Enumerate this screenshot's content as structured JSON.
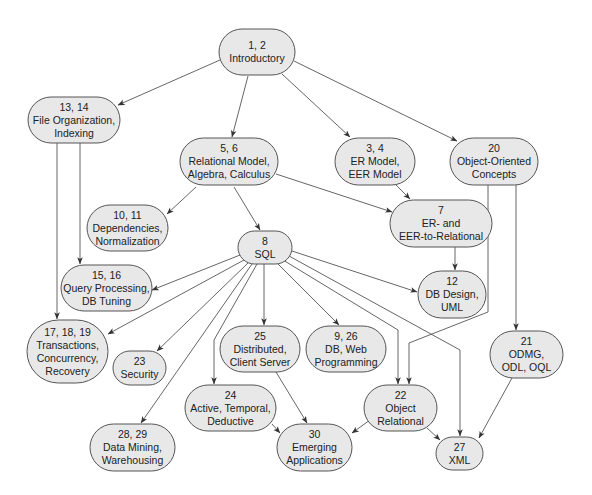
{
  "diagram": {
    "colors": {
      "node_fill": "#e8e8e8",
      "node_stroke": "#555555",
      "edge": "#555555",
      "text": "#222222",
      "background": "#ffffff"
    },
    "nodes": [
      {
        "id": "n1",
        "lines": [
          "1, 2",
          "Introductory"
        ],
        "x": 219,
        "y": 29,
        "w": 76,
        "h": 46
      },
      {
        "id": "n13",
        "lines": [
          "13, 14",
          "File Organization,",
          "Indexing"
        ],
        "x": 28,
        "y": 97,
        "w": 92,
        "h": 46
      },
      {
        "id": "n5",
        "lines": [
          "5, 6",
          "Relational Model,",
          "Algebra, Calculus"
        ],
        "x": 180,
        "y": 138,
        "w": 98,
        "h": 47
      },
      {
        "id": "n3",
        "lines": [
          "3, 4",
          "ER Model,",
          "EER Model"
        ],
        "x": 335,
        "y": 138,
        "w": 80,
        "h": 47
      },
      {
        "id": "n20",
        "lines": [
          "20",
          "Object-Oriented",
          "Concepts"
        ],
        "x": 450,
        "y": 138,
        "w": 88,
        "h": 47
      },
      {
        "id": "n10",
        "lines": [
          "10, 11",
          "Dependencies,",
          "Normalization"
        ],
        "x": 87,
        "y": 205,
        "w": 81,
        "h": 46
      },
      {
        "id": "n7",
        "lines": [
          "7",
          "ER- and",
          "EER-to-Relational"
        ],
        "x": 390,
        "y": 200,
        "w": 102,
        "h": 47
      },
      {
        "id": "n8",
        "lines": [
          "8",
          "SQL"
        ],
        "x": 238,
        "y": 231,
        "w": 54,
        "h": 33
      },
      {
        "id": "n15",
        "lines": [
          "15, 16",
          "Query Processing,",
          "DB Tuning"
        ],
        "x": 61,
        "y": 265,
        "w": 91,
        "h": 46
      },
      {
        "id": "n12",
        "lines": [
          "12",
          "DB Design,",
          "UML"
        ],
        "x": 418,
        "y": 271,
        "w": 68,
        "h": 47
      },
      {
        "id": "n17",
        "lines": [
          "17, 18, 19",
          "Transactions,",
          "Concurrency,",
          "Recovery"
        ],
        "x": 27,
        "y": 320,
        "w": 81,
        "h": 63
      },
      {
        "id": "n23",
        "lines": [
          "23",
          "Security"
        ],
        "x": 113,
        "y": 351,
        "w": 53,
        "h": 34
      },
      {
        "id": "n25",
        "lines": [
          "25",
          "Distributed,",
          "Client Server"
        ],
        "x": 220,
        "y": 326,
        "w": 80,
        "h": 46
      },
      {
        "id": "n9",
        "lines": [
          "9, 26",
          "DB, Web",
          "Programming"
        ],
        "x": 306,
        "y": 326,
        "w": 80,
        "h": 46
      },
      {
        "id": "n21",
        "lines": [
          "21",
          "ODMG,",
          "ODL, OQL"
        ],
        "x": 490,
        "y": 331,
        "w": 73,
        "h": 47
      },
      {
        "id": "n24",
        "lines": [
          "24",
          "Active, Temporal,",
          "Deductive"
        ],
        "x": 185,
        "y": 385,
        "w": 91,
        "h": 46
      },
      {
        "id": "n22",
        "lines": [
          "22",
          "Object",
          "Relational"
        ],
        "x": 364,
        "y": 385,
        "w": 73,
        "h": 46
      },
      {
        "id": "n28",
        "lines": [
          "28, 29",
          "Data Mining,",
          "Warehousing"
        ],
        "x": 90,
        "y": 424,
        "w": 85,
        "h": 47
      },
      {
        "id": "n30",
        "lines": [
          "30",
          "Emerging",
          "Applications"
        ],
        "x": 277,
        "y": 424,
        "w": 75,
        "h": 47
      },
      {
        "id": "n27",
        "lines": [
          "27",
          "XML"
        ],
        "x": 436,
        "y": 437,
        "w": 47,
        "h": 33
      }
    ],
    "edges": [
      {
        "from": "n1",
        "to": "n13",
        "points": [
          [
            220,
            60
          ],
          [
            118,
            105
          ]
        ]
      },
      {
        "from": "n1",
        "to": "n5",
        "points": [
          [
            248,
            76
          ],
          [
            232,
            137
          ]
        ]
      },
      {
        "from": "n1",
        "to": "n3",
        "points": [
          [
            282,
            74
          ],
          [
            350,
            137
          ]
        ]
      },
      {
        "from": "n1",
        "to": "n20",
        "points": [
          [
            294,
            61
          ],
          [
            457,
            141
          ]
        ]
      },
      {
        "from": "n13",
        "to": "n17",
        "points": [
          [
            57,
            143
          ],
          [
            57,
            319
          ]
        ]
      },
      {
        "from": "n13",
        "to": "n15",
        "points": [
          [
            80,
            143
          ],
          [
            80,
            264
          ]
        ]
      },
      {
        "from": "n5",
        "to": "n10",
        "points": [
          [
            196,
            187
          ],
          [
            167,
            214
          ]
        ]
      },
      {
        "from": "n5",
        "to": "n8",
        "points": [
          [
            234,
            187
          ],
          [
            260,
            230
          ]
        ]
      },
      {
        "from": "n5",
        "to": "n7",
        "points": [
          [
            276,
            174
          ],
          [
            392,
            212
          ]
        ]
      },
      {
        "from": "n3",
        "to": "n7",
        "points": [
          [
            396,
            185
          ],
          [
            410,
            199
          ]
        ]
      },
      {
        "from": "n7",
        "to": "n12",
        "points": [
          [
            455,
            247
          ],
          [
            455,
            270
          ]
        ]
      },
      {
        "from": "n20",
        "to": "n22",
        "points": [
          [
            488,
            185
          ],
          [
            488,
            312
          ],
          [
            409,
            343
          ],
          [
            409,
            384
          ]
        ]
      },
      {
        "from": "n20",
        "to": "n21",
        "points": [
          [
            516,
            185
          ],
          [
            516,
            330
          ]
        ]
      },
      {
        "from": "n8",
        "to": "n15",
        "points": [
          [
            240,
            255
          ],
          [
            152,
            290
          ]
        ]
      },
      {
        "from": "n8",
        "to": "n17",
        "points": [
          [
            244,
            260
          ],
          [
            108,
            334
          ]
        ]
      },
      {
        "from": "n8",
        "to": "n23",
        "points": [
          [
            248,
            263
          ],
          [
            157,
            351
          ]
        ]
      },
      {
        "from": "n8",
        "to": "n28",
        "points": [
          [
            252,
            264
          ],
          [
            141,
            423
          ]
        ]
      },
      {
        "from": "n8",
        "to": "n24",
        "points": [
          [
            257,
            264
          ],
          [
            214,
            340
          ],
          [
            214,
            384
          ]
        ]
      },
      {
        "from": "n8",
        "to": "n25",
        "points": [
          [
            264,
            264
          ],
          [
            264,
            325
          ]
        ]
      },
      {
        "from": "n8",
        "to": "n9",
        "points": [
          [
            277,
            263
          ],
          [
            339,
            325
          ]
        ]
      },
      {
        "from": "n8",
        "to": "n22",
        "points": [
          [
            283,
            260
          ],
          [
            398,
            330
          ],
          [
            398,
            384
          ]
        ]
      },
      {
        "from": "n8",
        "to": "n27",
        "points": [
          [
            289,
            256
          ],
          [
            460,
            350
          ],
          [
            460,
            436
          ]
        ]
      },
      {
        "from": "n8",
        "to": "n12",
        "points": [
          [
            292,
            251
          ],
          [
            417,
            292
          ]
        ]
      },
      {
        "from": "n25",
        "to": "n30",
        "points": [
          [
            276,
            372
          ],
          [
            307,
            423
          ]
        ]
      },
      {
        "from": "n24",
        "to": "n30",
        "points": [
          [
            272,
            424
          ],
          [
            280,
            433
          ]
        ]
      },
      {
        "from": "n22",
        "to": "n30",
        "points": [
          [
            370,
            420
          ],
          [
            352,
            433
          ]
        ]
      },
      {
        "from": "n22",
        "to": "n27",
        "points": [
          [
            427,
            428
          ],
          [
            440,
            440
          ]
        ]
      },
      {
        "from": "n21",
        "to": "n27",
        "points": [
          [
            512,
            378
          ],
          [
            479,
            438
          ]
        ]
      }
    ]
  }
}
